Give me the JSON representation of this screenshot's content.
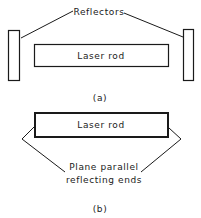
{
  "diagram_a": {
    "reflectors_label": "Reflectors",
    "rod_label": "Laser rod",
    "caption": "(a)"
  },
  "diagram_b": {
    "rod_label": "Laser rod",
    "ends_label_line1": "Plane parallel",
    "ends_label_line2": "reflecting ends",
    "caption": "(b)"
  },
  "colors": {
    "stroke": "#1a1a1a",
    "background": "#ffffff"
  }
}
